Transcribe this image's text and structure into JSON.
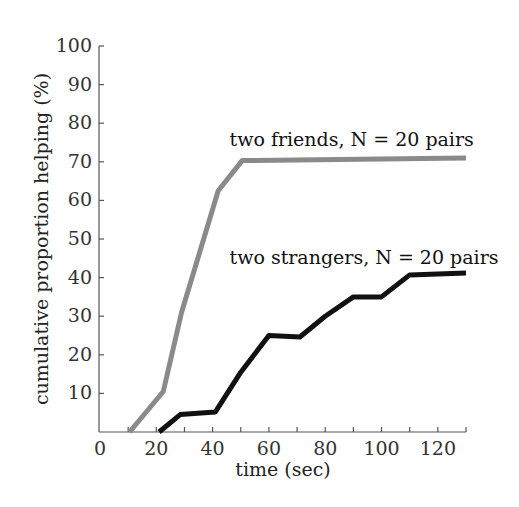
{
  "chart_data": {
    "type": "line",
    "title": "",
    "xlabel": "time (sec)",
    "ylabel": "cumulative proportion helping (%)",
    "xlim": [
      0,
      130
    ],
    "ylim": [
      0,
      100
    ],
    "xticks": [
      0,
      20,
      40,
      60,
      80,
      100,
      120
    ],
    "xminor_ticks": [
      10,
      30,
      50,
      70,
      90,
      110,
      130
    ],
    "yticks": [
      10,
      20,
      30,
      40,
      50,
      60,
      70,
      80,
      90,
      100
    ],
    "grid": false,
    "legend": "inline annotations",
    "series": [
      {
        "name": "two friends, N = 20 pairs",
        "color": "#8a8a8a",
        "x": [
          10.5,
          22.5,
          29,
          42,
          50.5,
          130
        ],
        "y": [
          0,
          10.5,
          31,
          62.5,
          70.3,
          71
        ]
      },
      {
        "name": "two strangers, N = 20 pairs",
        "color": "#111111",
        "x": [
          21,
          28.5,
          41,
          50,
          60,
          71,
          80,
          90,
          100,
          110,
          130
        ],
        "y": [
          0,
          4.5,
          5.2,
          15.5,
          25,
          24.6,
          30,
          35,
          35,
          40.7,
          41.2
        ]
      }
    ],
    "annotations": [
      {
        "text": "two friends, N = 20 pairs",
        "x": 46,
        "y": 74
      },
      {
        "text": "two strangers, N = 20 pairs",
        "x": 46,
        "y": 43.5
      }
    ]
  }
}
